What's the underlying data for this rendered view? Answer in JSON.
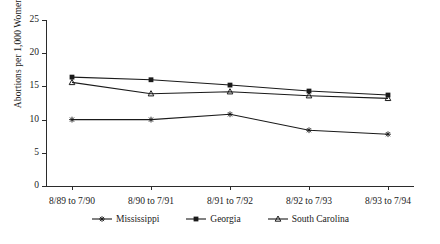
{
  "chart_data": {
    "type": "line",
    "title": "",
    "xlabel": "",
    "ylabel": "Abortions per 1,000 Women",
    "categories": [
      "8/89 to 7/90",
      "8/90 to 7/91",
      "8/91 to 7/92",
      "8/92 to 7/93",
      "8/93 to 7/94"
    ],
    "ylim": [
      0,
      25
    ],
    "yticks": [
      0,
      5,
      10,
      15,
      20,
      25
    ],
    "grid": false,
    "legend_position": "bottom",
    "series": [
      {
        "name": "Mississippi",
        "marker": "star",
        "color": "#1a1a1a",
        "values": [
          10.0,
          10.0,
          10.8,
          8.4,
          7.8
        ]
      },
      {
        "name": "Georgia",
        "marker": "square",
        "color": "#1a1a1a",
        "values": [
          16.4,
          16.0,
          15.2,
          14.3,
          13.7
        ]
      },
      {
        "name": "South Carolina",
        "marker": "triangle",
        "color": "#1a1a1a",
        "values": [
          15.6,
          13.9,
          14.2,
          13.6,
          13.2
        ]
      }
    ]
  }
}
